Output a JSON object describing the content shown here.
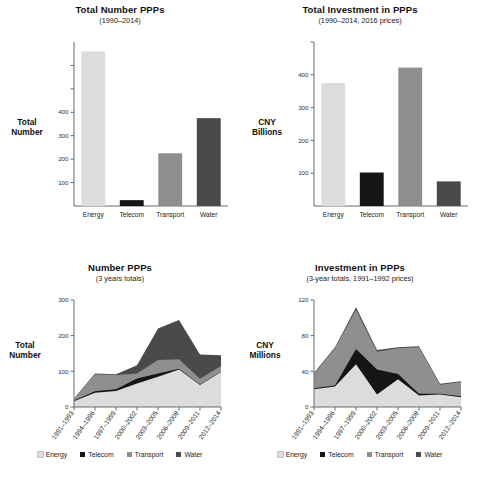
{
  "colors": {
    "energy": "#dcdcdc",
    "telecom": "#151515",
    "transport": "#8f8f8f",
    "water": "#4a4a4a",
    "axis": "#6b6b6b",
    "text": "#1a1a1a"
  },
  "legend": {
    "items": [
      {
        "label": "Energy",
        "color": "#dcdcdc"
      },
      {
        "label": "Telecom",
        "color": "#151515"
      },
      {
        "label": "Transport",
        "color": "#8f8f8f"
      },
      {
        "label": "Water",
        "color": "#4a4a4a"
      }
    ]
  },
  "charts": {
    "top_left": {
      "title": "Total Number PPPs",
      "subtitle": "(1990–2014)",
      "axis_label_line1": "Total",
      "axis_label_line2": "Number"
    },
    "top_right": {
      "title": "Total Investment in PPPs",
      "subtitle": "(1990–2014, 2016 prices)",
      "axis_label_line1": "CNY",
      "axis_label_line2": "Billions"
    },
    "bottom_left": {
      "title": "Number PPPs",
      "subtitle": "(3 years totals)",
      "axis_label_line1": "Total",
      "axis_label_line2": "Number"
    },
    "bottom_right": {
      "title": "Investment in PPPs",
      "subtitle": "(3-year totals, 1991–1992 prices)",
      "axis_label_line1": "CNY",
      "axis_label_line2": "Millions"
    }
  },
  "chart_data": [
    {
      "id": "total-number-ppps",
      "type": "bar",
      "title": "Total Number PPPs",
      "subtitle": "(1990–2014)",
      "xlabel": "",
      "ylabel": "Total Number",
      "categories": [
        "Energy",
        "Telecom",
        "Transport",
        "Water"
      ],
      "values": [
        660,
        25,
        225,
        375
      ],
      "colors": [
        "#dcdcdc",
        "#151515",
        "#8f8f8f",
        "#4a4a4a"
      ],
      "ylim": [
        0,
        700
      ],
      "yticks": [
        100,
        200,
        300,
        400,
        500,
        600
      ],
      "ytick_labels": [
        "100",
        "200",
        "300",
        "400",
        "",
        ""
      ],
      "grid": false,
      "legend": "none"
    },
    {
      "id": "total-investment-ppps",
      "type": "bar",
      "title": "Total Investment in PPPs",
      "subtitle": "(1990–2014, 2016 prices)",
      "xlabel": "",
      "ylabel": "CNY Billions",
      "categories": [
        "Energy",
        "Telecom",
        "Transport",
        "Water"
      ],
      "values": [
        375,
        102,
        422,
        75
      ],
      "colors": [
        "#dcdcdc",
        "#151515",
        "#8f8f8f",
        "#4a4a4a"
      ],
      "ylim": [
        0,
        500
      ],
      "yticks": [
        100,
        200,
        300,
        400,
        500
      ],
      "ytick_labels": [
        "100",
        "200",
        "300",
        "400",
        ""
      ],
      "grid": false,
      "legend": "none"
    },
    {
      "id": "number-ppps-3yr",
      "type": "area",
      "stacked": true,
      "title": "Number PPPs",
      "subtitle": "(3 years totals)",
      "xlabel": "",
      "ylabel": "Total Number",
      "x": [
        "1991–1993",
        "1994–1996",
        "1997–1999",
        "2000–2002",
        "2003–2005",
        "2006–2008",
        "2009–2011",
        "2012–2014"
      ],
      "series": [
        {
          "name": "Energy",
          "color": "#dcdcdc",
          "values": [
            16,
            40,
            45,
            66,
            85,
            105,
            62,
            98
          ]
        },
        {
          "name": "Telecom",
          "color": "#151515",
          "values": [
            2,
            4,
            5,
            14,
            9,
            2,
            1,
            1
          ]
        },
        {
          "name": "Transport",
          "color": "#8f8f8f",
          "values": [
            5,
            48,
            40,
            14,
            38,
            27,
            16,
            16
          ]
        },
        {
          "name": "Water",
          "color": "#4a4a4a",
          "values": [
            1,
            2,
            2,
            23,
            88,
            110,
            68,
            30
          ]
        }
      ],
      "totals": [
        24,
        94,
        92,
        117,
        220,
        244,
        147,
        145
      ],
      "ylim": [
        0,
        300
      ],
      "yticks": [
        0,
        100,
        200,
        300
      ],
      "ytick_labels": [
        "0",
        "100",
        "200",
        "300"
      ],
      "grid": false,
      "legend": "bottom"
    },
    {
      "id": "investment-ppps-3yr",
      "type": "area",
      "stacked": true,
      "title": "Investment in PPPs",
      "subtitle": "(3-year totals, 1991–1992 prices)",
      "xlabel": "",
      "ylabel": "CNY Millions",
      "x": [
        "1991–1993",
        "1994–1996",
        "1997–1999",
        "2000–2002",
        "2003–2005",
        "2006–2008",
        "2009–2011",
        "2012–2014"
      ],
      "series": [
        {
          "name": "Energy",
          "color": "#dcdcdc",
          "values": [
            20,
            23,
            48,
            14,
            31,
            13,
            14,
            11
          ]
        },
        {
          "name": "Telecom",
          "color": "#151515",
          "values": [
            1,
            1,
            17,
            28,
            6,
            2,
            1,
            1
          ]
        },
        {
          "name": "Transport",
          "color": "#8f8f8f",
          "values": [
            16,
            42,
            44,
            20,
            29,
            52,
            10,
            16
          ]
        },
        {
          "name": "Water",
          "color": "#4a4a4a",
          "values": [
            1,
            1,
            3,
            2,
            1,
            1,
            1,
            1
          ]
        }
      ],
      "totals": [
        38,
        67,
        112,
        64,
        67,
        68,
        26,
        29
      ],
      "ylim": [
        0,
        120
      ],
      "yticks": [
        0,
        40,
        80,
        120
      ],
      "ytick_labels": [
        "0",
        "40",
        "80",
        "120"
      ],
      "grid": false,
      "legend": "bottom"
    }
  ]
}
